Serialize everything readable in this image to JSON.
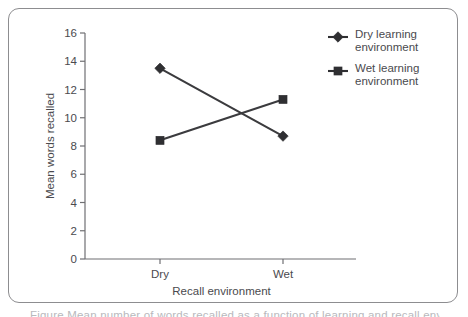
{
  "figure": {
    "caption_sliver": "Figure   Mean number of words recalled as a function of learning and recall environment"
  },
  "chart_data": {
    "type": "line",
    "title": "",
    "xlabel": "Recall environment",
    "ylabel": "Mean words recalled",
    "categories": [
      "Dry",
      "Wet"
    ],
    "ylim": [
      0,
      16
    ],
    "yticks": [
      0,
      2,
      4,
      6,
      8,
      10,
      12,
      14,
      16
    ],
    "ytick_labels": [
      "0",
      "2",
      "4",
      "6",
      "8",
      "10",
      "12",
      "14",
      "16"
    ],
    "grid": false,
    "legend_position": "top-right",
    "series": [
      {
        "name": "Dry learning environment",
        "marker": "diamond",
        "color": "#2f2f32",
        "values": [
          13.5,
          8.7
        ]
      },
      {
        "name": "Wet learning environment",
        "marker": "square",
        "color": "#2f2f32",
        "values": [
          8.4,
          11.3
        ]
      }
    ]
  }
}
